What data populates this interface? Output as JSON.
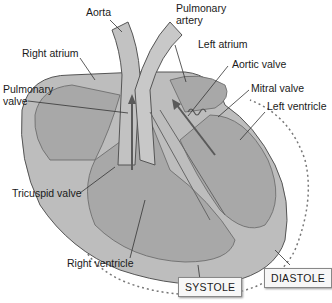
{
  "diagram": {
    "labels": {
      "aorta": "Aorta",
      "pulmonary_artery": "Pulmonary\nartery",
      "pulmonary_artery_line1": "Pulmonary",
      "pulmonary_artery_line2": "artery",
      "right_atrium": "Right atrium",
      "left_atrium": "Left atrium",
      "pulmonary_valve_line1": "Pulmonary",
      "pulmonary_valve_line2": "valve",
      "aortic_valve": "Aortic valve",
      "mitral_valve": "Mitral valve",
      "left_ventricle": "Left ventricle",
      "tricuspid_valve": "Tricuspid valve",
      "right_ventricle": "Right ventricle"
    },
    "callouts": {
      "systole": "SYSTOLE",
      "diastole": "DIASTOLE"
    },
    "colors": {
      "tissue": "#b5b5b5",
      "chamber": "#a3a3a3",
      "outline": "#555555",
      "arrow": "#5a5a5a",
      "dotted": "#777777"
    }
  }
}
